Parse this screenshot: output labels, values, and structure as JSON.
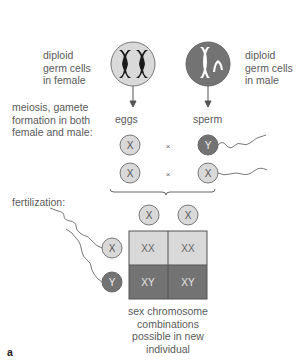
{
  "labels": {
    "female_germ": [
      "diploid",
      "germ cells",
      "in female"
    ],
    "male_germ": [
      "diploid",
      "germ cells",
      "in male"
    ],
    "meiosis": [
      "meiosis, gamete",
      "formation in both",
      "female and male:"
    ],
    "eggs": "eggs",
    "sperm": "sperm",
    "fertilization": "fertilization:",
    "combinations": [
      "sex chromosome",
      "combinations",
      "possible in new",
      "individual"
    ],
    "panel_letter": "a"
  },
  "gametes": {
    "egg_row1": "X",
    "egg_row2": "X",
    "sperm_row1": "Y",
    "sperm_row2": "X",
    "cross_symbol": "×"
  },
  "punnett": {
    "column_headers": [
      "X",
      "X"
    ],
    "row_headers": [
      "X",
      "Y"
    ],
    "cells": [
      [
        "XX",
        "XX"
      ],
      [
        "XY",
        "XY"
      ]
    ]
  },
  "colors": {
    "light_gray": "#d9d9d9",
    "dark_gray": "#737373",
    "line": "#555555",
    "text": "#5a5a5a"
  }
}
